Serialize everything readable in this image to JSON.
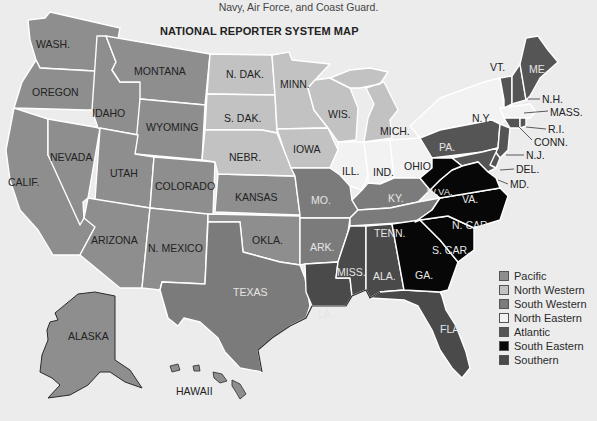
{
  "caption": {
    "text": "Navy, Air Force, and Coast Guard.",
    "right_fragment": "y,"
  },
  "title": "NATIONAL REPORTER SYSTEM MAP",
  "colors": {
    "pacific": "#8e8e8e",
    "north_western": "#c2c2c2",
    "south_western": "#7b7b7b",
    "north_eastern": "#f2f2f2",
    "atlantic": "#555555",
    "south_eastern": "#070707",
    "southern": "#4a4a4a",
    "background": "#ececec"
  },
  "states": {
    "wash": "WASH.",
    "oregon": "OREGON",
    "calif": "CALIF.",
    "nevada": "NEVADA",
    "idaho": "IDAHO",
    "montana": "MONTANA",
    "wyoming": "WYOMING",
    "utah": "UTAH",
    "colorado": "COLORADO",
    "arizona": "ARIZONA",
    "nmexico": "N. MEXICO",
    "kansas": "KANSAS",
    "okla": "OKLA.",
    "ndak": "N. DAK.",
    "sdak": "S. DAK.",
    "nebr": "NEBR.",
    "minn": "MINN.",
    "iowa": "IOWA",
    "wis": "WIS.",
    "mich": "MICH.",
    "ill": "ILL.",
    "ind": "IND.",
    "ohio": "OHIO",
    "texas": "TEXAS",
    "mo": "MO.",
    "ark": "ARK.",
    "ky": "KY.",
    "tenn": "TENN.",
    "la": "LA.",
    "miss": "MISS.",
    "ala": "ALA.",
    "fla": "FLA.",
    "ga": "GA.",
    "scar": "S. CAR.",
    "ncar": "N. CAR.",
    "va": "VA.",
    "wva": "W.VA.",
    "md": "MD.",
    "del": "DEL.",
    "nj": "N.J.",
    "pa": "PA.",
    "ny": "N.Y.",
    "conn": "CONN.",
    "ri": "R.I.",
    "mass": "MASS.",
    "nh": "N.H.",
    "vt": "VT.",
    "me": "ME.",
    "alaska": "ALASKA",
    "hawaii": "HAWAII"
  },
  "legend": [
    {
      "label": "Pacific",
      "color": "#8e8e8e"
    },
    {
      "label": "North Western",
      "color": "#c2c2c2"
    },
    {
      "label": "South Western",
      "color": "#7b7b7b"
    },
    {
      "label": "North Eastern",
      "color": "#f2f2f2"
    },
    {
      "label": "Atlantic",
      "color": "#555555"
    },
    {
      "label": "South Eastern",
      "color": "#070707"
    },
    {
      "label": "Southern",
      "color": "#4a4a4a"
    }
  ]
}
